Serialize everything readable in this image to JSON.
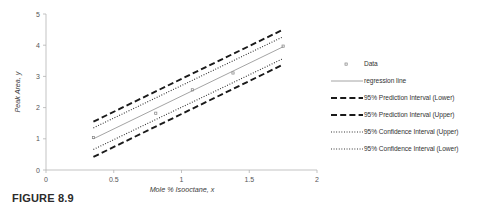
{
  "caption": "FIGURE 8.9",
  "legend": {
    "items": [
      {
        "label": "Data",
        "key": "marker-dot"
      },
      {
        "label": "regression line",
        "key": "solid-line"
      },
      {
        "label": "95% Prediction Interval (Lower)",
        "key": "dashed-line"
      },
      {
        "label": "95% Prediction Interval (Upper)",
        "key": "dashed-line"
      },
      {
        "label": "95% Confidence Interval (Upper)",
        "key": "dotted-line"
      },
      {
        "label": "95% Confidence Interval (Lower)",
        "key": "dotted-line"
      }
    ]
  },
  "chart_data": {
    "type": "scatter",
    "title": "",
    "xlabel": "Mole % Isooctane, x",
    "ylabel": "Peak Area, y",
    "xlim": [
      0,
      2
    ],
    "ylim": [
      0,
      5
    ],
    "xticks": [
      "0",
      "0.5",
      "1",
      "1.5",
      "2"
    ],
    "xtick_values": [
      0,
      0.5,
      1,
      1.5,
      2
    ],
    "yticks": [
      "0",
      "1",
      "2",
      "3",
      "4",
      "5"
    ],
    "ytick_values": [
      0,
      1,
      2,
      3,
      4,
      5
    ],
    "grid": false,
    "legend_position": "right",
    "points": {
      "name": "Data",
      "x": [
        0.35,
        0.81,
        1.08,
        1.38,
        1.75
      ],
      "y": [
        1.04,
        1.82,
        2.57,
        3.11,
        3.97
      ]
    },
    "series": [
      {
        "name": "regression line",
        "style": "solid",
        "x": [
          0.35,
          1.75
        ],
        "y": [
          1.0,
          3.95
        ]
      },
      {
        "name": "95% Prediction Interval (Upper)",
        "style": "dashed",
        "x": [
          0.35,
          1.75
        ],
        "y": [
          1.55,
          4.5
        ]
      },
      {
        "name": "95% Prediction Interval (Lower)",
        "style": "dashed",
        "x": [
          0.35,
          1.75
        ],
        "y": [
          0.42,
          3.38
        ]
      },
      {
        "name": "95% Confidence Interval (Upper)",
        "style": "dotted",
        "x": [
          0.35,
          1.75
        ],
        "y": [
          1.35,
          4.27
        ]
      },
      {
        "name": "95% Confidence Interval (Lower)",
        "style": "dotted",
        "x": [
          0.35,
          1.75
        ],
        "y": [
          0.66,
          3.57
        ]
      }
    ]
  }
}
